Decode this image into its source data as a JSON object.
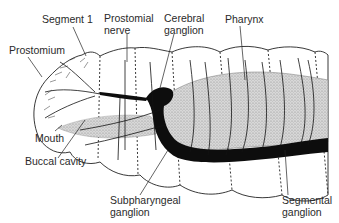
{
  "diagram": {
    "labels": {
      "segment_1": "Segment 1",
      "prostomial_nerve_line1": "Prostomial",
      "prostomial_nerve_line2": "nerve",
      "cerebral_ganglion_line1": "Cerebral",
      "cerebral_ganglion_line2": "ganglion",
      "pharynx": "Pharynx",
      "prostomium": "Prostomium",
      "mouth": "Mouth",
      "buccal_cavity": "Buccal cavity",
      "subpharyngeal_ganglion_line1": "Subpharyngeal",
      "subpharyngeal_ganglion_line2": "ganglion",
      "segmental_ganglion_line1": "Segmental",
      "segmental_ganglion_line2": "ganglion"
    },
    "colors": {
      "ink": "#111111",
      "stipple": "#bdbdbd",
      "background": "#ffffff"
    }
  }
}
